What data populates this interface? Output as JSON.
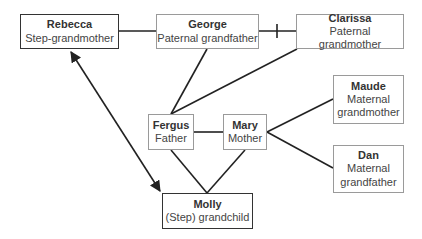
{
  "diagram": {
    "type": "family-tree",
    "nodes": [
      {
        "id": "rebecca",
        "name": "Rebecca",
        "role": "Step-grandmother",
        "emphasis": true
      },
      {
        "id": "george",
        "name": "George",
        "role": "Paternal grandfather",
        "emphasis": false
      },
      {
        "id": "clarissa",
        "name": "Clarissa",
        "role": "Paternal grandmother",
        "emphasis": false
      },
      {
        "id": "maude",
        "name": "Maude",
        "role": "Maternal grandmother",
        "emphasis": false
      },
      {
        "id": "dan",
        "name": "Dan",
        "role": "Maternal grandfather",
        "emphasis": false
      },
      {
        "id": "fergus",
        "name": "Fergus",
        "role": "Father",
        "emphasis": false
      },
      {
        "id": "mary",
        "name": "Mary",
        "role": "Mother",
        "emphasis": false
      },
      {
        "id": "molly",
        "name": "Molly",
        "role": "(Step) grandchild",
        "emphasis": true
      }
    ],
    "edges": [
      {
        "from": "rebecca",
        "to": "george",
        "kind": "partner"
      },
      {
        "from": "george",
        "to": "clarissa",
        "kind": "divorced"
      },
      {
        "from": "george",
        "to": "fergus",
        "kind": "parent-child"
      },
      {
        "from": "clarissa",
        "to": "fergus",
        "kind": "parent-child"
      },
      {
        "from": "fergus",
        "to": "mary",
        "kind": "partner"
      },
      {
        "from": "mary",
        "to": "maude",
        "kind": "parent-child"
      },
      {
        "from": "mary",
        "to": "dan",
        "kind": "parent-child"
      },
      {
        "from": "fergus",
        "to": "molly",
        "kind": "parent-child"
      },
      {
        "from": "mary",
        "to": "molly",
        "kind": "parent-child"
      },
      {
        "from": "rebecca",
        "to": "molly",
        "kind": "bidirectional-relationship"
      }
    ],
    "colors": {
      "line": "#222222",
      "box_border": "#9a9a9a",
      "emph_border": "#333333"
    }
  }
}
